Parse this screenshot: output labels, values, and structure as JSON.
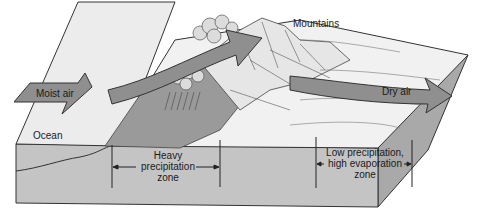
{
  "diagram": {
    "type": "orographic-precipitation-block-diagram",
    "labels": {
      "mountains": "Mountains",
      "moist_air": "Moist air",
      "dry_air": "Dry air",
      "ocean": "Ocean",
      "heavy_zone_line1": "Heavy",
      "heavy_zone_line2": "precipitation",
      "heavy_zone_line3": "zone",
      "low_zone_line1": "Low precipitation,",
      "low_zone_line2": "high evaporation",
      "low_zone_line3": "zone"
    },
    "colors": {
      "block_front": "#c4c4c4",
      "block_side": "#a9a9a9",
      "ocean_surface": "#e9e9e9",
      "land_surface": "#f1f1f1",
      "windward_slope": "#9a9a9a",
      "arrow_fill": "#8f8f8f",
      "cloud_fill": "#dcdcdc",
      "outline": "#333333"
    }
  }
}
